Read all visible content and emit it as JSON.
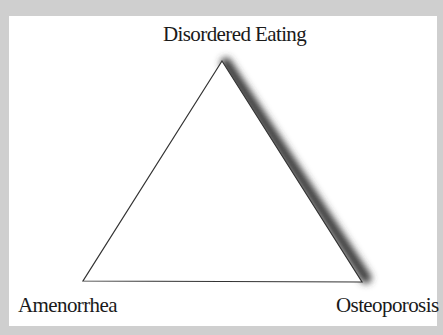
{
  "diagram": {
    "type": "triangle",
    "vertices": {
      "top": {
        "label": "Disordered Eating"
      },
      "bottom_left": {
        "label": "Amenorrhea"
      },
      "bottom_right": {
        "label": "Osteoporosis"
      }
    },
    "colors": {
      "background": "#cfcfcf",
      "panel": "#ffffff",
      "stroke": "#333333",
      "shadow": "#444444",
      "text": "#1a1a1a"
    }
  }
}
